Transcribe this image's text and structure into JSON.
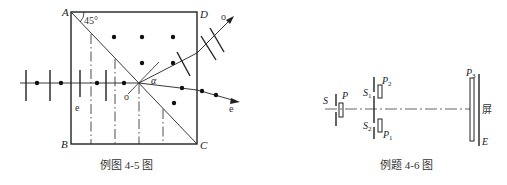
{
  "figure_left": {
    "caption": "例图 4-5 图",
    "corner_labels": {
      "a": "A",
      "b": "B",
      "c": "C",
      "d": "D"
    },
    "angle_label": "45°",
    "alpha_label": "α",
    "ray_o_label": "o",
    "ray_e_label": "e",
    "inner_o_label": "o",
    "inner_e_label": "e"
  },
  "figure_right": {
    "caption": "例题 4-6 图",
    "source_label": "S",
    "polarizer_label": "P",
    "slit1_label": "S",
    "slit1_sub": "1",
    "slit2_label": "S",
    "slit2_sub": "2",
    "p1_label": "P",
    "p1_sub": "1",
    "p2_label": "P",
    "p2_sub": "2",
    "p3_label": "P",
    "p3_sub": "3",
    "screen_label": "屏",
    "screen_e_label": "E"
  },
  "colors": {
    "ink": "#222222",
    "background": "#ffffff"
  }
}
